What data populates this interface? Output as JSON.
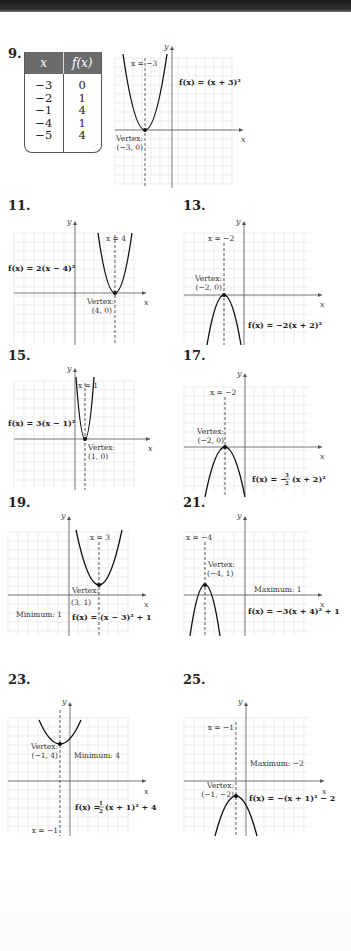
{
  "page": {
    "type": "textbook answer key - graphs of quadratic functions"
  },
  "problems": [
    {
      "number": "9.",
      "table": {
        "headers": [
          "x",
          "f(x)"
        ],
        "rows": [
          [
            "−3",
            "0"
          ],
          [
            "−2",
            "1"
          ],
          [
            "−1",
            "4"
          ],
          [
            "−4",
            "1"
          ],
          [
            "−5",
            "4"
          ]
        ]
      },
      "equation": "f(x) = (x + 3)²",
      "axis_line": "x = −3",
      "vertex_label": "Vertex:",
      "vertex_coords": "(−3, 0)",
      "x_axis_label": "x",
      "y_axis_label": "y"
    },
    {
      "number": "11.",
      "equation": "f(x) = 2(x − 4)²",
      "axis_line": "x = 4",
      "vertex_label": "Vertex:",
      "vertex_coords": "(4, 0)",
      "x_axis_label": "x",
      "y_axis_label": "y"
    },
    {
      "number": "13.",
      "equation": "f(x) = −2(x + 2)²",
      "axis_line": "x = −2",
      "vertex_label": "Vertex:",
      "vertex_coords": "(−2, 0)",
      "x_axis_label": "x",
      "y_axis_label": "y"
    },
    {
      "number": "15.",
      "equation": "f(x) = 3(x − 1)²",
      "axis_line": "x = 1",
      "vertex_label": "Vertex:",
      "vertex_coords": "(1, 0)",
      "x_axis_label": "x",
      "y_axis_label": "y"
    },
    {
      "number": "17.",
      "equation_prefix": "f(x) = −",
      "equation_frac_num": "3",
      "equation_frac_den": "2",
      "equation_suffix": "(x + 2)²",
      "axis_line": "x = −2",
      "vertex_label": "Vertex:",
      "vertex_coords": "(−2, 0)",
      "x_axis_label": "x",
      "y_axis_label": "y"
    },
    {
      "number": "19.",
      "equation": "f(x) = (x − 3)² + 1",
      "axis_line": "x = 3",
      "vertex_label": "Vertex:",
      "vertex_coords": "(3, 1)",
      "extreme_label": "Minimum: 1",
      "x_axis_label": "x",
      "y_axis_label": "y"
    },
    {
      "number": "21.",
      "equation": "f(x) = −3(x + 4)² + 1",
      "axis_line": "x = −4",
      "vertex_label": "Vertex:",
      "vertex_coords": "(−4, 1)",
      "extreme_label": "Maximum: 1",
      "x_axis_label": "x",
      "y_axis_label": "y"
    },
    {
      "number": "23.",
      "equation_prefix": "f(x) = ",
      "equation_frac_num": "1",
      "equation_frac_den": "2",
      "equation_suffix": "(x + 1)² + 4",
      "axis_line": "x = −1",
      "vertex_label": "Vertex:",
      "vertex_coords": "(−1, 4)",
      "extreme_label": "Minimum: 4",
      "x_axis_label": "x",
      "y_axis_label": "y"
    },
    {
      "number": "25.",
      "equation": "f(x) = −(x + 1)² − 2",
      "axis_line": "x = −1",
      "vertex_label": "Vertex:",
      "vertex_coords": "(−1, −2)",
      "extreme_label": "Maximum: −2",
      "x_axis_label": "x",
      "y_axis_label": "y"
    }
  ],
  "colors": {
    "grid": "#e2e2e2",
    "axis": "#555555",
    "curve": "#111111",
    "table_header": "#6b6b6b",
    "top_bar": "#222222"
  }
}
